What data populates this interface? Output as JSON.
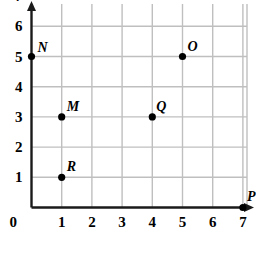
{
  "chart_data": {
    "type": "scatter",
    "title": "",
    "xlabel": "",
    "ylabel": "",
    "xlim": [
      0,
      7
    ],
    "ylim": [
      0,
      7
    ],
    "grid": true,
    "legend": "none",
    "x_ticks": [
      "0",
      "1",
      "2",
      "3",
      "4",
      "5",
      "6",
      "7"
    ],
    "y_ticks": [
      "0",
      "1",
      "2",
      "3",
      "4",
      "5",
      "6",
      "7"
    ],
    "points": [
      {
        "label": "N",
        "x": 0,
        "y": 5,
        "label_dx": 6,
        "label_dy": -16
      },
      {
        "label": "O",
        "x": 5,
        "y": 5,
        "label_dx": 5,
        "label_dy": -17
      },
      {
        "label": "M",
        "x": 1,
        "y": 3,
        "label_dx": 5,
        "label_dy": -17
      },
      {
        "label": "Q",
        "x": 4,
        "y": 3,
        "label_dx": 4,
        "label_dy": -17
      },
      {
        "label": "R",
        "x": 1,
        "y": 1,
        "label_dx": 5,
        "label_dy": -17
      },
      {
        "label": "P",
        "x": 7,
        "y": 0,
        "label_dx": 4,
        "label_dy": -18
      }
    ]
  },
  "style": {
    "axis_color": "#1a1a1a",
    "grid_color": "#bfbfbf",
    "point_color": "#000000",
    "background": "#ffffff"
  }
}
